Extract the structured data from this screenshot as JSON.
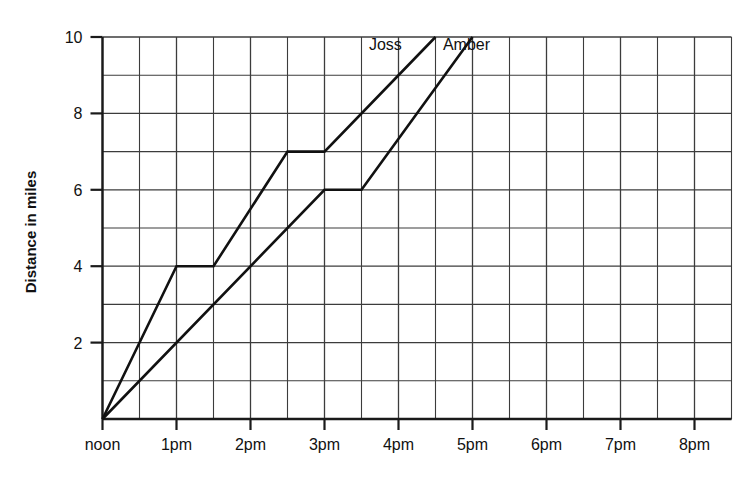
{
  "chart_data": {
    "type": "line",
    "title": "",
    "xlabel": "",
    "ylabel": "Distance in miles",
    "xlim": [
      12,
      20.5
    ],
    "ylim": [
      0,
      10
    ],
    "grid": true,
    "grid_minor_x_step_hours": 0.5,
    "grid_minor_y_step_miles": 1,
    "legend": "inline-labels",
    "x_tick_labels": [
      "noon",
      "1pm",
      "2pm",
      "3pm",
      "4pm",
      "5pm",
      "6pm",
      "7pm",
      "8pm"
    ],
    "x_tick_values": [
      12,
      13,
      14,
      15,
      16,
      17,
      18,
      19,
      20
    ],
    "y_tick_labels": [
      "2",
      "4",
      "6",
      "8",
      "10"
    ],
    "y_tick_values": [
      2,
      4,
      6,
      8,
      10
    ],
    "series": [
      {
        "name": "Joss",
        "label": "Joss",
        "label_x": 15.6,
        "label_y": 9.65,
        "points": [
          {
            "x": 12,
            "y": 0
          },
          {
            "x": 13,
            "y": 4
          },
          {
            "x": 13.5,
            "y": 4
          },
          {
            "x": 14.5,
            "y": 7
          },
          {
            "x": 15,
            "y": 7
          },
          {
            "x": 16.5,
            "y": 10
          }
        ]
      },
      {
        "name": "Amber",
        "label": "Amber",
        "label_x": 16.6,
        "label_y": 9.65,
        "points": [
          {
            "x": 12,
            "y": 0
          },
          {
            "x": 15,
            "y": 6
          },
          {
            "x": 15.5,
            "y": 6
          },
          {
            "x": 17,
            "y": 10
          }
        ]
      }
    ]
  },
  "axes": {
    "y_axis_title": "Distance in miles"
  },
  "colors": {
    "line": "#111111",
    "grid": "#3c3c3c",
    "axis": "#1a1a1a",
    "background": "#ffffff"
  }
}
